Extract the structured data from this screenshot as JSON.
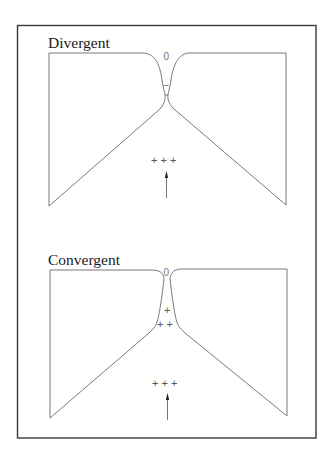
{
  "panels": [
    {
      "title": "Divergent",
      "throat_symbol": "0",
      "neck_symbol": "–",
      "inner_charges": [],
      "bottom_charges": "+ + +",
      "arrow": "up-arrow"
    },
    {
      "title": "Convergent",
      "throat_symbol": "0",
      "neck_symbol": "",
      "inner_charges": [
        "+",
        "+ +"
      ],
      "bottom_charges": "+ + +",
      "arrow": "up-arrow"
    }
  ]
}
